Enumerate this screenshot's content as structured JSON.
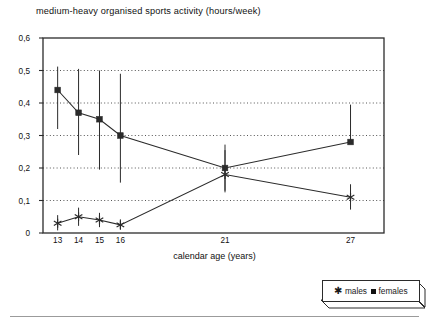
{
  "chart_data": {
    "type": "line",
    "title": "medium-heavy organised sports activity (hours/week)",
    "xlabel": "calendar age (years)",
    "ylabel": "",
    "categories": [
      "13",
      "14",
      "15",
      "16",
      "21",
      "27"
    ],
    "x": [
      13,
      14,
      15,
      16,
      21,
      27
    ],
    "xlim": [
      12.3,
      28.6
    ],
    "ylim": [
      0,
      0.6
    ],
    "yticks": [
      0,
      0.1,
      0.2,
      0.3,
      0.4,
      0.5,
      0.6
    ],
    "ytick_labels": [
      "0",
      "0,1",
      "0,2",
      "0,3",
      "0,4",
      "0,5",
      "0,6"
    ],
    "xtick_labels": [
      "13",
      "14",
      "15",
      "16",
      "21",
      "27"
    ],
    "grid": "horizontal-dotted",
    "legend_position": "below-right-outside",
    "series": [
      {
        "name": "males",
        "marker": "asterisk",
        "values": [
          0.03,
          0.05,
          0.04,
          0.025,
          0.18,
          0.11
        ],
        "err_low": [
          0.008,
          0.022,
          0.018,
          0.01,
          0.125,
          0.072
        ],
        "err_high": [
          0.055,
          0.078,
          0.062,
          0.042,
          0.255,
          0.15
        ]
      },
      {
        "name": "females",
        "marker": "square",
        "values": [
          0.44,
          0.37,
          0.35,
          0.3,
          0.2,
          0.28
        ],
        "err_low": [
          0.32,
          0.24,
          0.195,
          0.155,
          0.13,
          0.28
        ],
        "err_high": [
          0.512,
          0.505,
          0.5,
          0.49,
          0.272,
          0.395
        ]
      }
    ]
  },
  "legend": {
    "males_label": "males",
    "females_label": "females"
  },
  "colors": {
    "line": "#2b2b2b",
    "grid": "#555555",
    "frame": "#2b2b2b",
    "text": "#111111"
  }
}
